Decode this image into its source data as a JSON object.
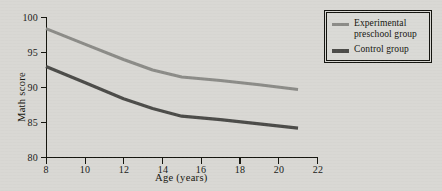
{
  "chart_data": {
    "type": "line",
    "title": "",
    "xlabel": "Age (years)",
    "ylabel": "Math score",
    "xlim": [
      8,
      22
    ],
    "ylim": [
      80,
      100
    ],
    "xticks": [
      8,
      10,
      12,
      14,
      16,
      18,
      20,
      22
    ],
    "yticks": [
      80,
      85,
      90,
      95,
      100
    ],
    "grid": false,
    "legend_position": "top-right outside",
    "series": [
      {
        "name": "Experimental preschool group",
        "color": "#8c8c88",
        "linewidth": 3,
        "x": [
          8,
          10,
          12,
          13.5,
          15,
          17,
          19,
          21
        ],
        "values": [
          98.4,
          96.2,
          94.0,
          92.5,
          91.5,
          91.0,
          90.4,
          89.7
        ]
      },
      {
        "name": "Control group",
        "color": "#4c4c49",
        "linewidth": 3.2,
        "x": [
          8,
          10,
          12,
          13.5,
          15,
          17,
          19,
          21
        ],
        "values": [
          93.0,
          90.7,
          88.4,
          87.0,
          85.9,
          85.4,
          84.8,
          84.2
        ]
      }
    ]
  },
  "axes": {
    "y_title": "Math score",
    "x_title": "Age (years)",
    "y_tick_labels": [
      "80",
      "85",
      "90",
      "95",
      "100"
    ],
    "x_tick_labels": [
      "8",
      "10",
      "12",
      "14",
      "16",
      "18",
      "20",
      "22"
    ]
  },
  "legend": {
    "entries": [
      {
        "label": "Experimental preschool group",
        "color": "#8c8c88"
      },
      {
        "label": "Control group",
        "color": "#4c4c49"
      }
    ]
  },
  "colors": {
    "background": "#d9d8d4",
    "axis": "#16160f",
    "experimental_line": "#8c8c88",
    "control_line": "#4c4c49",
    "text": "#16160f"
  }
}
